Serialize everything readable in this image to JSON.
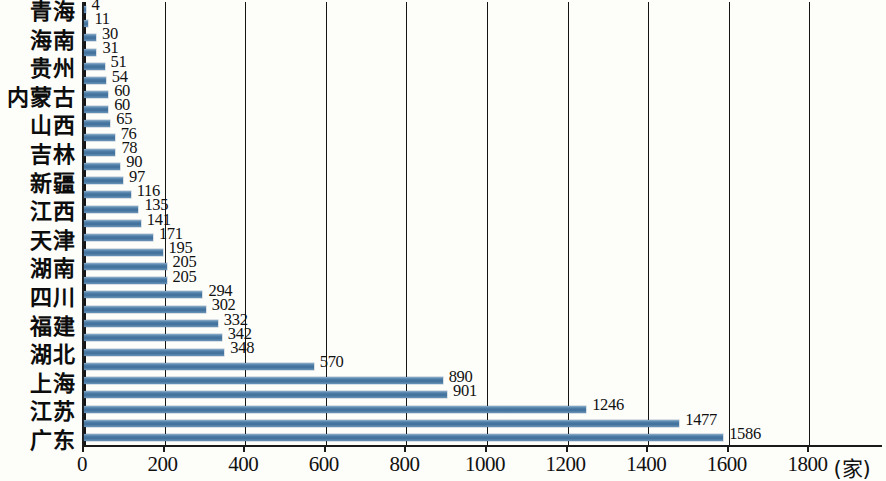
{
  "chart_data": {
    "type": "bar",
    "orientation": "horizontal",
    "title": "",
    "xlabel": "(家)",
    "ylabel": "",
    "xlim": [
      0,
      1800
    ],
    "xticks": [
      0,
      200,
      400,
      600,
      800,
      1000,
      1200,
      1400,
      1600,
      1800
    ],
    "xtick_labels": [
      "0",
      "200",
      "400",
      "600",
      "800",
      "1000",
      "1200",
      "1400",
      "1600",
      "1800"
    ],
    "unit_label": "(家)",
    "grid": true,
    "grid_axis": "x",
    "legend": "none",
    "bar_color": "#4f7ea8",
    "categories": [
      "青海",
      "",
      "海南",
      "",
      "贵州",
      "",
      "内蒙古",
      "",
      "山西",
      "",
      "吉林",
      "",
      "新疆",
      "",
      "江西",
      "",
      "天津",
      "",
      "湖南",
      "",
      "四川",
      "",
      "福建",
      "",
      "湖北",
      "",
      "上海",
      "",
      "江苏",
      "",
      "广东"
    ],
    "visible_category_labels": [
      "青海",
      "海南",
      "贵州",
      "内蒙古",
      "山西",
      "吉林",
      "新疆",
      "江西",
      "天津",
      "湖南",
      "四川",
      "福建",
      "湖北",
      "上海",
      "江苏",
      "广东"
    ],
    "values": [
      4,
      11,
      30,
      31,
      51,
      54,
      60,
      60,
      65,
      76,
      78,
      90,
      97,
      116,
      135,
      141,
      171,
      195,
      205,
      205,
      294,
      302,
      332,
      342,
      348,
      570,
      890,
      901,
      1246,
      1477,
      1586
    ],
    "value_labels": [
      "4",
      "11",
      "30",
      "31",
      "51",
      "54",
      "60",
      "60",
      "65",
      "76",
      "78",
      "90",
      "97",
      "116",
      "135",
      "141",
      "171",
      "195",
      "205",
      "205",
      "294",
      "302",
      "332",
      "342",
      "348",
      "570",
      "890",
      "901",
      "1246",
      "1477",
      "1586"
    ],
    "bars": [
      {
        "index": 0,
        "label": "青海",
        "value": 4
      },
      {
        "index": 1,
        "label": "",
        "value": 11
      },
      {
        "index": 2,
        "label": "海南",
        "value": 30
      },
      {
        "index": 3,
        "label": "",
        "value": 31
      },
      {
        "index": 4,
        "label": "贵州",
        "value": 51
      },
      {
        "index": 5,
        "label": "",
        "value": 54
      },
      {
        "index": 6,
        "label": "内蒙古",
        "value": 60
      },
      {
        "index": 7,
        "label": "",
        "value": 60
      },
      {
        "index": 8,
        "label": "山西",
        "value": 65
      },
      {
        "index": 9,
        "label": "",
        "value": 76
      },
      {
        "index": 10,
        "label": "吉林",
        "value": 78
      },
      {
        "index": 11,
        "label": "",
        "value": 90
      },
      {
        "index": 12,
        "label": "新疆",
        "value": 97
      },
      {
        "index": 13,
        "label": "",
        "value": 116
      },
      {
        "index": 14,
        "label": "江西",
        "value": 135
      },
      {
        "index": 15,
        "label": "",
        "value": 141
      },
      {
        "index": 16,
        "label": "天津",
        "value": 171
      },
      {
        "index": 17,
        "label": "",
        "value": 195
      },
      {
        "index": 18,
        "label": "湖南",
        "value": 205
      },
      {
        "index": 19,
        "label": "",
        "value": 205
      },
      {
        "index": 20,
        "label": "四川",
        "value": 294
      },
      {
        "index": 21,
        "label": "",
        "value": 302
      },
      {
        "index": 22,
        "label": "福建",
        "value": 332
      },
      {
        "index": 23,
        "label": "",
        "value": 342
      },
      {
        "index": 24,
        "label": "湖北",
        "value": 348
      },
      {
        "index": 25,
        "label": "",
        "value": 570
      },
      {
        "index": 26,
        "label": "上海",
        "value": 890
      },
      {
        "index": 27,
        "label": "",
        "value": 901
      },
      {
        "index": 28,
        "label": "江苏",
        "value": 1246
      },
      {
        "index": 29,
        "label": "",
        "value": 1477
      },
      {
        "index": 30,
        "label": "广东",
        "value": 1586
      }
    ]
  }
}
